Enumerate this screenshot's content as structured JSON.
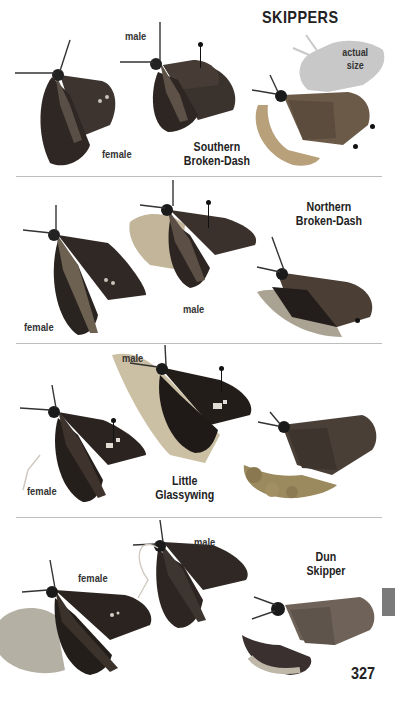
{
  "header": {
    "title": "SKIPPERS",
    "actual_size_label_line1": "actual",
    "actual_size_label_line2": "size"
  },
  "sections": [
    {
      "species_line1": "Southern",
      "species_line2": "Broken-Dash",
      "labels": [
        "male",
        "female"
      ]
    },
    {
      "species_line1": "Northern",
      "species_line2": "Broken-Dash",
      "labels": [
        "female",
        "male"
      ]
    },
    {
      "species_line1": "Little",
      "species_line2": "Glassywing",
      "labels": [
        "male",
        "female"
      ]
    },
    {
      "species_line1": "Dun",
      "species_line2": "Skipper",
      "labels": [
        "female",
        "male"
      ]
    }
  ],
  "footer": {
    "page_number": "327"
  },
  "colors": {
    "tab_marker": "#7a7a7a",
    "divider": "#bdbdbd",
    "silhouette": "#c8c8c8"
  }
}
